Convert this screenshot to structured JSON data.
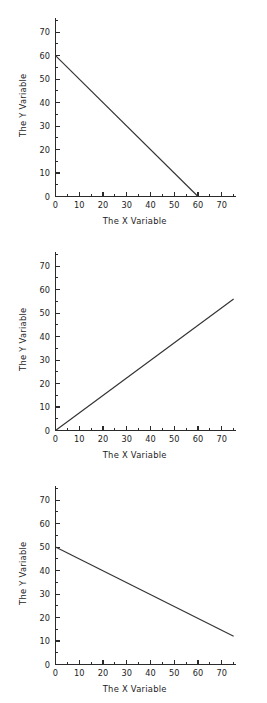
{
  "page": {
    "background": "#ffffff",
    "line_color": "#333333",
    "axis_color": "#2b2b2b",
    "text_color": "#1c1c1c"
  },
  "charts": [
    {
      "id": "chart-top",
      "title": "",
      "xlabel": "The X Variable",
      "ylabel": "The Y Variable",
      "xticks": [
        "0",
        "10",
        "20",
        "30",
        "40",
        "50",
        "60",
        "70"
      ],
      "yticks": [
        "0",
        "10",
        "20",
        "30",
        "40",
        "50",
        "60",
        "70"
      ],
      "xtick_values": [
        0,
        10,
        20,
        30,
        40,
        50,
        60,
        70
      ],
      "ytick_values": [
        0,
        10,
        20,
        30,
        40,
        50,
        60,
        70
      ],
      "xlim": [
        0,
        76
      ],
      "ylim": [
        0,
        76
      ],
      "minor_tick_step": 5,
      "line_points": [
        [
          0,
          60
        ],
        [
          60,
          0
        ]
      ]
    },
    {
      "id": "chart-middle",
      "title": "",
      "xlabel": "The X Variable",
      "ylabel": "The Y Variable",
      "xticks": [
        "0",
        "10",
        "20",
        "30",
        "40",
        "50",
        "60",
        "70"
      ],
      "yticks": [
        "0",
        "10",
        "20",
        "30",
        "40",
        "50",
        "60",
        "70"
      ],
      "xtick_values": [
        0,
        10,
        20,
        30,
        40,
        50,
        60,
        70
      ],
      "ytick_values": [
        0,
        10,
        20,
        30,
        40,
        50,
        60,
        70
      ],
      "xlim": [
        0,
        76
      ],
      "ylim": [
        0,
        76
      ],
      "minor_tick_step": 5,
      "line_points": [
        [
          0,
          0
        ],
        [
          75,
          56
        ]
      ]
    },
    {
      "id": "chart-bottom",
      "title": "",
      "xlabel": "The X Variable",
      "ylabel": "The Y Variable",
      "xticks": [
        "0",
        "10",
        "20",
        "30",
        "40",
        "50",
        "60",
        "70"
      ],
      "yticks": [
        "0",
        "10",
        "20",
        "30",
        "40",
        "50",
        "60",
        "70"
      ],
      "xtick_values": [
        0,
        10,
        20,
        30,
        40,
        50,
        60,
        70
      ],
      "ytick_values": [
        0,
        10,
        20,
        30,
        40,
        50,
        60,
        70
      ],
      "xlim": [
        0,
        76
      ],
      "ylim": [
        0,
        76
      ],
      "minor_tick_step": 5,
      "line_points": [
        [
          0,
          50
        ],
        [
          75,
          12
        ]
      ]
    }
  ],
  "chart_data": [
    {
      "type": "line",
      "title": "",
      "xlabel": "The X Variable",
      "ylabel": "The Y Variable",
      "xlim": [
        0,
        76
      ],
      "ylim": [
        0,
        76
      ],
      "grid": false,
      "legend": null,
      "x": [
        0,
        60
      ],
      "series": [
        {
          "name": "line 1",
          "values": [
            60,
            0
          ]
        }
      ],
      "description": "Straight descending line from (0, 60) to (60, 0); slope -1, y-intercept 60."
    },
    {
      "type": "line",
      "title": "",
      "xlabel": "The X Variable",
      "ylabel": "The Y Variable",
      "xlim": [
        0,
        76
      ],
      "ylim": [
        0,
        76
      ],
      "grid": false,
      "legend": null,
      "x": [
        0,
        75
      ],
      "series": [
        {
          "name": "line 2",
          "values": [
            0,
            56
          ]
        }
      ],
      "description": "Straight ascending line from (0, 0) to (75, 56); slope about 0.75, y-intercept 0."
    },
    {
      "type": "line",
      "title": "",
      "xlabel": "The X Variable",
      "ylabel": "The Y Variable",
      "xlim": [
        0,
        76
      ],
      "ylim": [
        0,
        76
      ],
      "grid": false,
      "legend": null,
      "x": [
        0,
        75
      ],
      "series": [
        {
          "name": "line 3",
          "values": [
            50,
            12
          ]
        }
      ],
      "description": "Straight descending line from (0, 50) to (75, 12); slope about -0.507, y-intercept 50."
    }
  ]
}
